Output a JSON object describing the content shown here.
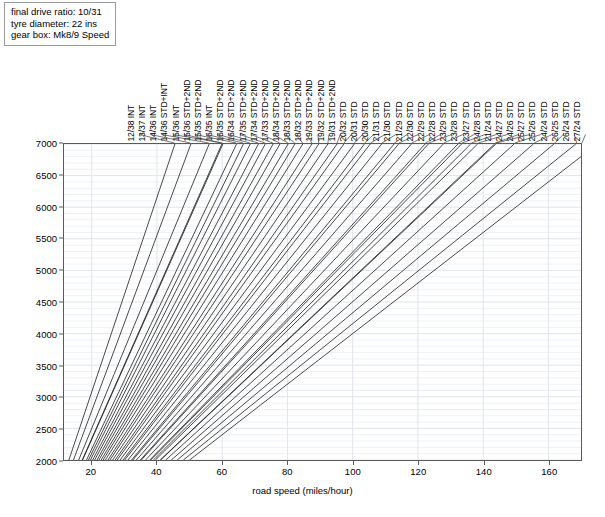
{
  "info_box": {
    "lines": [
      "final drive ratio: 10/31",
      "tyre diameter: 22 ins",
      "gear box: Mk8/9 Speed"
    ]
  },
  "axes": {
    "x_title": "road speed (miles/hour)",
    "y_title": "engine revs (rev/min)",
    "x_ticks": [
      20,
      40,
      60,
      80,
      100,
      120,
      140,
      160
    ],
    "y_ticks": [
      2000,
      2500,
      3000,
      3500,
      4000,
      4500,
      5000,
      5500,
      6000,
      6500,
      7000
    ],
    "xlim": [
      11.5,
      170
    ],
    "ylim": [
      2000,
      7000
    ],
    "grid": true,
    "grid_color": "#e8ecf0",
    "frame_color": "#5a5a5a"
  },
  "chart_data": {
    "type": "line",
    "title": "",
    "xlabel": "road speed (miles/hour)",
    "ylabel": "engine revs (rev/min)",
    "xlim": [
      11.5,
      170
    ],
    "ylim": [
      2000,
      7000
    ],
    "grid": true,
    "legend_position": "top-rotated-labels",
    "note": "Each line is a gear ratio: engine revs rise linearly with road speed from 2000 rpm. Values are speed in miles/hour at the given engine revs.",
    "series": [
      {
        "name": "12/38 INT",
        "speed_at_2000rpm": 13.0,
        "speed_at_7000rpm": 45.5
      },
      {
        "name": "13/37 INT",
        "speed_at_2000rpm": 14.4,
        "speed_at_7000rpm": 50.4
      },
      {
        "name": "14/36 INT",
        "speed_at_2000rpm": 16.0,
        "speed_at_7000rpm": 56.0
      },
      {
        "name": "14/36 STD+INT",
        "speed_at_2000rpm": 17.2,
        "speed_at_7000rpm": 60.2
      },
      {
        "name": "15/36 INT",
        "speed_at_2000rpm": 17.1,
        "speed_at_7000rpm": 59.9
      },
      {
        "name": "15/36 STD+2ND",
        "speed_at_2000rpm": 18.4,
        "speed_at_7000rpm": 64.4
      },
      {
        "name": "15/35 STD+2ND",
        "speed_at_2000rpm": 19.0,
        "speed_at_7000rpm": 66.5
      },
      {
        "name": "16/35 INT",
        "speed_at_2000rpm": 19.6,
        "speed_at_7000rpm": 68.6
      },
      {
        "name": "16/35 STD+2ND",
        "speed_at_2000rpm": 20.3,
        "speed_at_7000rpm": 71.1
      },
      {
        "name": "16/34 STD+2ND",
        "speed_at_2000rpm": 20.9,
        "speed_at_7000rpm": 73.2
      },
      {
        "name": "17/35 STD+2ND",
        "speed_at_2000rpm": 21.6,
        "speed_at_7000rpm": 75.6
      },
      {
        "name": "17/34 STD+2ND",
        "speed_at_2000rpm": 22.2,
        "speed_at_7000rpm": 77.7
      },
      {
        "name": "17/33 STD+2ND",
        "speed_at_2000rpm": 22.9,
        "speed_at_7000rpm": 80.2
      },
      {
        "name": "18/34 STD+2ND",
        "speed_at_2000rpm": 23.5,
        "speed_at_7000rpm": 82.3
      },
      {
        "name": "18/33 STD+2ND",
        "speed_at_2000rpm": 24.2,
        "speed_at_7000rpm": 84.7
      },
      {
        "name": "18/32 STD+2ND",
        "speed_at_2000rpm": 25.0,
        "speed_at_7000rpm": 87.5
      },
      {
        "name": "19/33 STD+2ND",
        "speed_at_2000rpm": 25.6,
        "speed_at_7000rpm": 89.6
      },
      {
        "name": "19/32 STD+2ND",
        "speed_at_2000rpm": 26.4,
        "speed_at_7000rpm": 92.4
      },
      {
        "name": "19/31 STD+2ND",
        "speed_at_2000rpm": 27.2,
        "speed_at_7000rpm": 95.2
      },
      {
        "name": "20/32 STD",
        "speed_at_2000rpm": 27.8,
        "speed_at_7000rpm": 97.3
      },
      {
        "name": "20/31 STD",
        "speed_at_2000rpm": 28.7,
        "speed_at_7000rpm": 100.5
      },
      {
        "name": "20/30 STD",
        "speed_at_2000rpm": 29.6,
        "speed_at_7000rpm": 103.6
      },
      {
        "name": "21/31 STD",
        "speed_at_2000rpm": 30.1,
        "speed_at_7000rpm": 105.4
      },
      {
        "name": "21/30 STD",
        "speed_at_2000rpm": 31.1,
        "speed_at_7000rpm": 108.9
      },
      {
        "name": "21/29 STD",
        "speed_at_2000rpm": 32.2,
        "speed_at_7000rpm": 112.7
      },
      {
        "name": "22/30 STD",
        "speed_at_2000rpm": 32.6,
        "speed_at_7000rpm": 114.1
      },
      {
        "name": "22/29 STD",
        "speed_at_2000rpm": 33.7,
        "speed_at_7000rpm": 118.0
      },
      {
        "name": "22/28 STD",
        "speed_at_2000rpm": 34.9,
        "speed_at_7000rpm": 122.2
      },
      {
        "name": "23/29 STD",
        "speed_at_2000rpm": 35.2,
        "speed_at_7000rpm": 123.2
      },
      {
        "name": "23/28 STD",
        "speed_at_2000rpm": 36.5,
        "speed_at_7000rpm": 127.8
      },
      {
        "name": "23/27 STD",
        "speed_at_2000rpm": 37.8,
        "speed_at_7000rpm": 132.3
      },
      {
        "name": "24/28 STD",
        "speed_at_2000rpm": 38.1,
        "speed_at_7000rpm": 133.4
      },
      {
        "name": "21/24 STD",
        "speed_at_2000rpm": 38.9,
        "speed_at_7000rpm": 136.2
      },
      {
        "name": "24/27 STD",
        "speed_at_2000rpm": 39.5,
        "speed_at_7000rpm": 138.3
      },
      {
        "name": "24/26 STD",
        "speed_at_2000rpm": 41.0,
        "speed_at_7000rpm": 143.5
      },
      {
        "name": "25/27 STD",
        "speed_at_2000rpm": 41.1,
        "speed_at_7000rpm": 143.9
      },
      {
        "name": "25/26 STD",
        "speed_at_2000rpm": 42.7,
        "speed_at_7000rpm": 149.5
      },
      {
        "name": "24/24 STD",
        "speed_at_2000rpm": 44.4,
        "speed_at_7000rpm": 155.4
      },
      {
        "name": "26/25 STD",
        "speed_at_2000rpm": 46.2,
        "speed_at_7000rpm": 161.7
      },
      {
        "name": "26/24 STD",
        "speed_at_2000rpm": 48.1,
        "speed_at_7000rpm": 168.4
      },
      {
        "name": "27/24 STD",
        "speed_at_2000rpm": 50.0,
        "speed_at_7000rpm": 175.0
      }
    ]
  }
}
